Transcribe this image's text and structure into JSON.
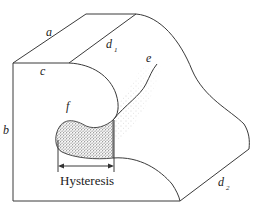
{
  "diagram": {
    "labels": {
      "a": "a",
      "b": "b",
      "c": "c",
      "d1_main": "d",
      "d1_sub": "1",
      "d2_main": "d",
      "d2_sub": "2",
      "e": "e",
      "f": "f",
      "hysteresis": "Hysteresis"
    },
    "colors": {
      "stroke": "#3a3a3a",
      "stipple": "#555555",
      "background": "#ffffff"
    }
  }
}
